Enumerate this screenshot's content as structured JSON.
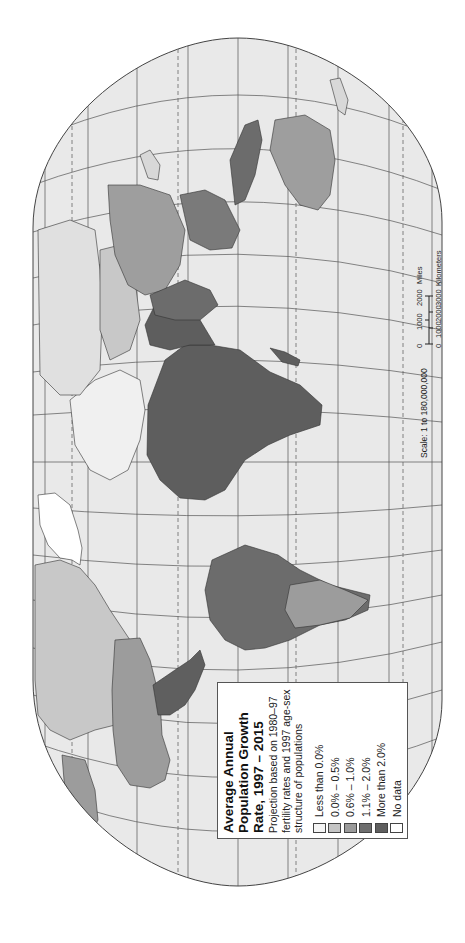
{
  "legend": {
    "title_lines": [
      "Average Annual",
      "Population Growth",
      "Rate, 1997 – 2015"
    ],
    "subtitle": "Projection based on 1980–97 fertility rates and 1997 age-sex structure of populations",
    "items": [
      {
        "label": "Less than 0.0%",
        "color": "#f4f4f4"
      },
      {
        "label": "0.0% – 0.5%",
        "color": "#c4c4c4"
      },
      {
        "label": "0.6% – 1.0%",
        "color": "#9a9a9a"
      },
      {
        "label": "1.1% – 2.0%",
        "color": "#6e6e6e"
      },
      {
        "label": "More than 2.0%",
        "color": "#5e5e5e"
      },
      {
        "label": "No data",
        "color": "#ffffff"
      }
    ]
  },
  "scale": {
    "ratio": "Scale:  1 to 180,000,000",
    "miles_label": "Miles",
    "miles_ticks": [
      "0",
      "1000",
      "2000"
    ],
    "km_label": "Kilometers",
    "km_ticks": [
      "0",
      "1000",
      "2000",
      "3000"
    ]
  },
  "colors": {
    "ocean": "#e9e9e9",
    "land_base": "#d9d9d9",
    "frame": "#444444",
    "graticule": "#555555"
  },
  "regions": [
    {
      "name": "north-america-canada",
      "class": "0.6-1.0"
    },
    {
      "name": "united-states",
      "class": "0.6-1.0"
    },
    {
      "name": "mexico-central-america",
      "class": "more-than-2.0"
    },
    {
      "name": "south-america",
      "class": "1.1-2.0"
    },
    {
      "name": "africa",
      "class": "more-than-2.0"
    },
    {
      "name": "europe",
      "class": "less-than-0.0"
    },
    {
      "name": "russia",
      "class": "less-than-0.0"
    },
    {
      "name": "middle-east",
      "class": "more-than-2.0"
    },
    {
      "name": "south-asia",
      "class": "1.1-2.0"
    },
    {
      "name": "china",
      "class": "0.6-1.0"
    },
    {
      "name": "southeast-asia",
      "class": "1.1-2.0"
    },
    {
      "name": "australia",
      "class": "0.6-1.0"
    },
    {
      "name": "greenland",
      "class": "no-data"
    }
  ]
}
